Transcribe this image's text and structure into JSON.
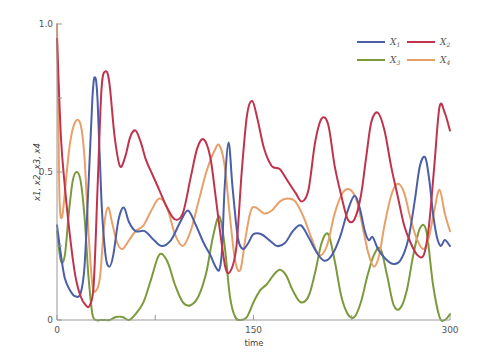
{
  "chart_data": {
    "type": "line",
    "title": "",
    "xlabel": "time",
    "ylabel": "x1, x2, x3, x4",
    "xlim": [
      0,
      300
    ],
    "ylim": [
      0,
      1.0
    ],
    "xticks": [
      0,
      75,
      150,
      225,
      300
    ],
    "xtick_labels": [
      "0",
      "",
      "150",
      "",
      "300"
    ],
    "yticks": [
      0,
      0.25,
      0.5,
      0.75,
      1.0
    ],
    "ytick_labels": [
      "0",
      "",
      "0.5",
      "",
      "1.0"
    ],
    "grid": false,
    "legend_position": "upper right",
    "series": [
      {
        "name": "x1",
        "label_base": "X",
        "label_sub": "1",
        "color": "#4a5fa8",
        "x": [
          0,
          3,
          6,
          10,
          14,
          18,
          21,
          24,
          27,
          29,
          31,
          34,
          37,
          40,
          43,
          47,
          51,
          55,
          60,
          67,
          74,
          80,
          87,
          94,
          100,
          106,
          112,
          117,
          121,
          124,
          126,
          128,
          131,
          134,
          138,
          142,
          146,
          150,
          156,
          162,
          168,
          174,
          180,
          186,
          192,
          198,
          204,
          210,
          216,
          222,
          227,
          231,
          235,
          238,
          241,
          245,
          250,
          256,
          262,
          268,
          273,
          277,
          281,
          284,
          287,
          290,
          293,
          296,
          300
        ],
        "y": [
          0.32,
          0.22,
          0.14,
          0.1,
          0.08,
          0.09,
          0.18,
          0.45,
          0.75,
          0.82,
          0.74,
          0.4,
          0.22,
          0.18,
          0.22,
          0.34,
          0.38,
          0.33,
          0.3,
          0.3,
          0.27,
          0.25,
          0.27,
          0.33,
          0.37,
          0.32,
          0.26,
          0.22,
          0.18,
          0.17,
          0.24,
          0.45,
          0.6,
          0.45,
          0.28,
          0.24,
          0.26,
          0.29,
          0.29,
          0.27,
          0.25,
          0.26,
          0.3,
          0.32,
          0.28,
          0.23,
          0.2,
          0.22,
          0.28,
          0.37,
          0.42,
          0.38,
          0.3,
          0.27,
          0.28,
          0.24,
          0.21,
          0.19,
          0.2,
          0.27,
          0.4,
          0.52,
          0.55,
          0.48,
          0.36,
          0.28,
          0.25,
          0.27,
          0.25
        ]
      },
      {
        "name": "x2",
        "label_base": "X",
        "label_sub": "2",
        "color": "#c0334d",
        "x": [
          0,
          3,
          6,
          10,
          14,
          18,
          22,
          25,
          28,
          31,
          34,
          37,
          40,
          44,
          48,
          52,
          56,
          60,
          64,
          68,
          73,
          78,
          84,
          90,
          96,
          102,
          107,
          112,
          117,
          121,
          125,
          129,
          133,
          137,
          141,
          145,
          149,
          153,
          158,
          164,
          170,
          176,
          182,
          187,
          192,
          197,
          202,
          207,
          212,
          217,
          222,
          227,
          232,
          236,
          240,
          245,
          250,
          255,
          260,
          265,
          270,
          275,
          280,
          284,
          288,
          292,
          296,
          300
        ],
        "y": [
          0.95,
          0.62,
          0.45,
          0.28,
          0.15,
          0.08,
          0.05,
          0.05,
          0.12,
          0.45,
          0.78,
          0.84,
          0.8,
          0.62,
          0.52,
          0.55,
          0.62,
          0.64,
          0.6,
          0.54,
          0.49,
          0.44,
          0.38,
          0.34,
          0.36,
          0.48,
          0.58,
          0.61,
          0.55,
          0.42,
          0.28,
          0.17,
          0.17,
          0.25,
          0.5,
          0.69,
          0.74,
          0.68,
          0.58,
          0.52,
          0.51,
          0.47,
          0.43,
          0.4,
          0.44,
          0.6,
          0.68,
          0.66,
          0.52,
          0.42,
          0.34,
          0.34,
          0.42,
          0.55,
          0.67,
          0.7,
          0.64,
          0.52,
          0.42,
          0.32,
          0.26,
          0.22,
          0.22,
          0.32,
          0.52,
          0.72,
          0.7,
          0.64
        ]
      },
      {
        "name": "x3",
        "label_base": "X",
        "label_sub": "3",
        "color": "#7a9a3c",
        "x": [
          0,
          3,
          6,
          9,
          12,
          15,
          18,
          21,
          24,
          27,
          30,
          33,
          36,
          40,
          45,
          50,
          55,
          60,
          66,
          72,
          78,
          84,
          90,
          96,
          102,
          108,
          114,
          119,
          124,
          128,
          132,
          136,
          140,
          145,
          150,
          155,
          160,
          165,
          170,
          175,
          180,
          186,
          192,
          197,
          202,
          207,
          212,
          217,
          222,
          227,
          232,
          237,
          242,
          247,
          252,
          257,
          262,
          267,
          272,
          277,
          282,
          287,
          292,
          296,
          300
        ],
        "y": [
          0.3,
          0.2,
          0.22,
          0.36,
          0.47,
          0.5,
          0.47,
          0.35,
          0.15,
          0.02,
          0.0,
          0.0,
          0.0,
          0.0,
          0.01,
          0.01,
          0.0,
          0.02,
          0.06,
          0.14,
          0.22,
          0.2,
          0.12,
          0.06,
          0.05,
          0.08,
          0.16,
          0.28,
          0.35,
          0.25,
          0.08,
          0.01,
          0.0,
          0.01,
          0.06,
          0.1,
          0.12,
          0.15,
          0.17,
          0.15,
          0.1,
          0.06,
          0.08,
          0.16,
          0.26,
          0.29,
          0.2,
          0.08,
          0.02,
          0.01,
          0.06,
          0.15,
          0.22,
          0.24,
          0.15,
          0.05,
          0.04,
          0.1,
          0.22,
          0.31,
          0.3,
          0.12,
          0.01,
          0.0,
          0.02
        ]
      },
      {
        "name": "x4",
        "label_base": "X",
        "label_sub": "4",
        "color": "#e8a06a",
        "x": [
          0,
          1,
          2,
          4,
          7,
          10,
          14,
          18,
          21,
          24,
          27,
          30,
          33,
          36,
          39,
          42,
          46,
          50,
          55,
          60,
          66,
          72,
          78,
          84,
          90,
          96,
          102,
          108,
          114,
          120,
          124,
          128,
          132,
          136,
          140,
          144,
          148,
          152,
          158,
          164,
          170,
          176,
          182,
          188,
          194,
          200,
          206,
          212,
          218,
          224,
          229,
          234,
          238,
          242,
          246,
          250,
          255,
          260,
          265,
          270,
          275,
          280,
          284,
          288,
          292,
          296,
          300
        ],
        "y": [
          1.0,
          0.7,
          0.4,
          0.35,
          0.48,
          0.6,
          0.67,
          0.66,
          0.55,
          0.3,
          0.12,
          0.1,
          0.15,
          0.32,
          0.38,
          0.33,
          0.26,
          0.24,
          0.27,
          0.3,
          0.32,
          0.37,
          0.41,
          0.38,
          0.29,
          0.25,
          0.3,
          0.4,
          0.5,
          0.57,
          0.59,
          0.52,
          0.35,
          0.2,
          0.17,
          0.28,
          0.37,
          0.38,
          0.36,
          0.37,
          0.4,
          0.41,
          0.4,
          0.35,
          0.28,
          0.22,
          0.25,
          0.36,
          0.43,
          0.44,
          0.4,
          0.3,
          0.22,
          0.18,
          0.22,
          0.32,
          0.42,
          0.46,
          0.43,
          0.34,
          0.27,
          0.24,
          0.28,
          0.37,
          0.44,
          0.36,
          0.3
        ]
      }
    ]
  }
}
